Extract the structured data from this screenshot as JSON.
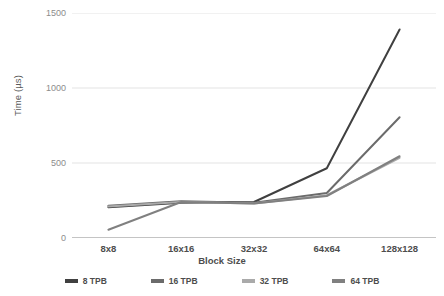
{
  "chart_data": {
    "type": "line",
    "title": "",
    "xlabel": "Block Size",
    "ylabel": "Time (µs)",
    "categories": [
      "8x8",
      "16x16",
      "32x32",
      "64x64",
      "128x128"
    ],
    "ylim": [
      0,
      1500
    ],
    "yticks": [
      0,
      500,
      1000,
      1500
    ],
    "ytick_labels": [
      "0",
      "500",
      "1000",
      "1500"
    ],
    "grid": "horizontal",
    "legend_position": "bottom",
    "series": [
      {
        "name": "8 TPB",
        "color": "#404040",
        "values": [
          205,
          235,
          240,
          465,
          1390
        ]
      },
      {
        "name": "16 TPB",
        "color": "#6b6b6b",
        "values": [
          215,
          245,
          235,
          300,
          805
        ]
      },
      {
        "name": "32 TPB",
        "color": "#aaaaaa",
        "values": [
          210,
          240,
          230,
          285,
          535
        ]
      },
      {
        "name": "64 TPB",
        "color": "#808080",
        "values": [
          55,
          240,
          230,
          280,
          545
        ]
      }
    ]
  },
  "axis": {
    "y_title": "Time (µs)",
    "x_title": "Block Size"
  },
  "colors": {
    "gridline": "#e3e3e3",
    "axisline": "#b0b0b0",
    "tick_text": "#8c8c8c",
    "label_text": "#4d4d4d"
  }
}
